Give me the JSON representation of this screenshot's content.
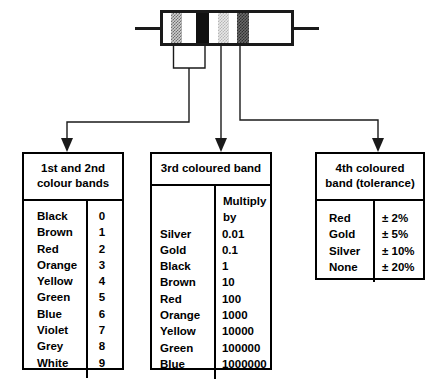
{
  "diagram": {
    "resistor": {
      "label": "resistor",
      "bands": [
        {
          "position": "1st",
          "shade": "#cfcfcf"
        },
        {
          "position": "2nd",
          "shade": "#111111"
        },
        {
          "position": "3rd",
          "shade": "#e8e8e8"
        },
        {
          "position": "4th",
          "shade": "#6a6a6a"
        }
      ]
    },
    "colors": {
      "line": "#000000",
      "body_outline": "#1a1a1a",
      "background": "#ffffff"
    }
  },
  "box_colour_bands": {
    "header": "1st and 2nd\ncolour bands",
    "header_line1": "1st and 2nd",
    "header_line2": "colour bands",
    "rows": [
      {
        "name": "Black",
        "value": "0"
      },
      {
        "name": "Brown",
        "value": "1"
      },
      {
        "name": "Red",
        "value": "2"
      },
      {
        "name": "Orange",
        "value": "3"
      },
      {
        "name": "Yellow",
        "value": "4"
      },
      {
        "name": "Green",
        "value": "5"
      },
      {
        "name": "Blue",
        "value": "6"
      },
      {
        "name": "Violet",
        "value": "7"
      },
      {
        "name": "Grey",
        "value": "8"
      },
      {
        "name": "White",
        "value": "9"
      }
    ]
  },
  "box_third_band": {
    "header": "3rd coloured band",
    "value_column_header": "Multiply by",
    "rows": [
      {
        "name": "Silver",
        "value": "0.01"
      },
      {
        "name": "Gold",
        "value": "0.1"
      },
      {
        "name": "Black",
        "value": "1"
      },
      {
        "name": "Brown",
        "value": "10"
      },
      {
        "name": "Red",
        "value": "100"
      },
      {
        "name": "Orange",
        "value": "1000"
      },
      {
        "name": "Yellow",
        "value": "10000"
      },
      {
        "name": "Green",
        "value": "100000"
      },
      {
        "name": "Blue",
        "value": "1000000"
      }
    ]
  },
  "box_tolerance": {
    "header_line1": "4th coloured",
    "header_line2": "band (tolerance)",
    "rows": [
      {
        "name": "Red",
        "value": "± 2%"
      },
      {
        "name": "Gold",
        "value": "± 5%"
      },
      {
        "name": "Silver",
        "value": "± 10%"
      },
      {
        "name": "None",
        "value": "± 20%"
      }
    ]
  }
}
